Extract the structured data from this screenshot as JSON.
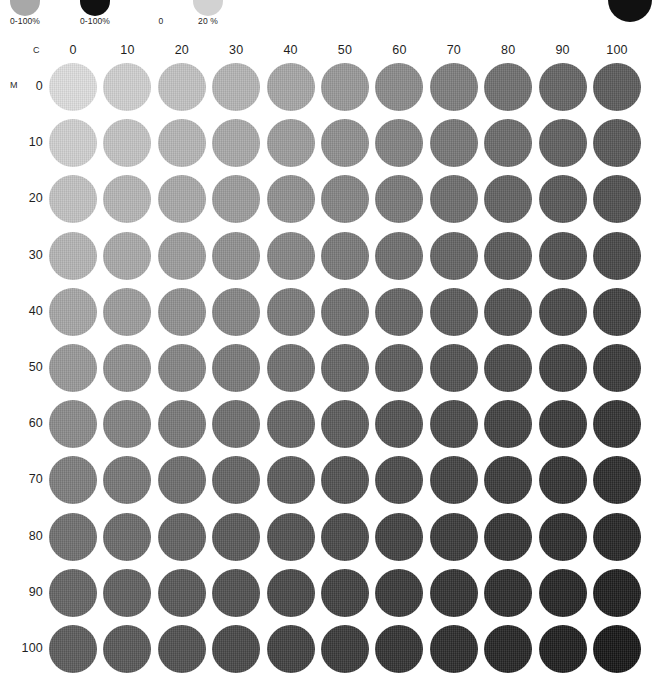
{
  "page": {
    "background": "#ffffff",
    "width": 649,
    "height": 673
  },
  "legend": {
    "items": [
      {
        "name": "gray-ramp-swatch",
        "label": "0-100%",
        "color": "#a8a8a8",
        "x": 25,
        "top": -14,
        "size": 30
      },
      {
        "name": "black-ramp-swatch",
        "label": "0-100%",
        "color": "#111111",
        "x": 95,
        "top": -14,
        "size": 30
      },
      {
        "name": "zero-tint-swatch",
        "label": "0",
        "color": "#ffffff",
        "x": 161,
        "top": -14,
        "size": 30
      },
      {
        "name": "twenty-tint-swatch",
        "label": "20 %",
        "color": "#d2d2d2",
        "x": 208,
        "top": -14,
        "size": 30
      }
    ],
    "corner_dot": {
      "name": "corner-black-dot",
      "color": "#111111",
      "x": 608,
      "top": -22,
      "size": 44
    }
  },
  "chart_data": {
    "type": "heatmap",
    "xlabel": "C",
    "ylabel": "M",
    "grid": false,
    "legend_position": "top",
    "unit": "%",
    "x": [
      0,
      10,
      20,
      30,
      40,
      50,
      60,
      70,
      80,
      90,
      100
    ],
    "y": [
      0,
      10,
      20,
      30,
      40,
      50,
      60,
      70,
      80,
      90,
      100
    ],
    "xtick_labels": [
      "0",
      "10",
      "20",
      "30",
      "40",
      "50",
      "60",
      "70",
      "80",
      "90",
      "100"
    ],
    "ytick_labels": [
      "0",
      "10",
      "20",
      "30",
      "40",
      "50",
      "60",
      "70",
      "80",
      "90",
      "100"
    ],
    "xlim": [
      0,
      100
    ],
    "ylim": [
      0,
      100
    ],
    "value_description": "Rendered gray level of each C/M halftone patch (0 = white paper, 100 = solid black)",
    "values": [
      [
        13,
        19,
        25,
        31,
        37,
        43,
        49,
        55,
        61,
        67,
        72
      ],
      [
        19,
        25,
        31,
        36,
        42,
        48,
        54,
        59,
        65,
        70,
        75
      ],
      [
        25,
        31,
        36,
        42,
        47,
        53,
        58,
        63,
        69,
        74,
        78
      ],
      [
        31,
        36,
        42,
        47,
        52,
        57,
        63,
        68,
        72,
        77,
        81
      ],
      [
        37,
        42,
        47,
        52,
        57,
        62,
        67,
        72,
        76,
        80,
        84
      ],
      [
        43,
        48,
        53,
        57,
        62,
        67,
        71,
        76,
        80,
        84,
        87
      ],
      [
        49,
        54,
        58,
        63,
        67,
        71,
        76,
        80,
        83,
        87,
        90
      ],
      [
        55,
        59,
        63,
        68,
        72,
        76,
        80,
        83,
        87,
        90,
        92
      ],
      [
        61,
        65,
        69,
        72,
        76,
        80,
        83,
        87,
        90,
        92,
        94
      ],
      [
        67,
        70,
        74,
        77,
        80,
        84,
        87,
        90,
        92,
        94,
        96
      ],
      [
        72,
        75,
        78,
        81,
        84,
        87,
        90,
        92,
        94,
        96,
        97
      ]
    ],
    "colors": [
      [
        "#dedede",
        "#d0d0d0",
        "#c2c2c2",
        "#b4b4b4",
        "#a6a6a6",
        "#989898",
        "#8a8a8a",
        "#7d7d7d",
        "#6f6f6f",
        "#646464",
        "#5b5b5b"
      ],
      [
        "#d0d0d0",
        "#c3c3c3",
        "#b5b5b5",
        "#a9a9a9",
        "#9c9c9c",
        "#8f8f8f",
        "#828282",
        "#767676",
        "#6a6a6a",
        "#5f5f5f",
        "#575757"
      ],
      [
        "#c2c2c2",
        "#b5b5b5",
        "#a9a9a9",
        "#9c9c9c",
        "#909090",
        "#848484",
        "#787878",
        "#6d6d6d",
        "#616161",
        "#575757",
        "#4f4f4f"
      ],
      [
        "#b4b4b4",
        "#a9a9a9",
        "#9c9c9c",
        "#909090",
        "#858585",
        "#797979",
        "#6e6e6e",
        "#636363",
        "#585858",
        "#4f4f4f",
        "#474747"
      ],
      [
        "#a6a6a6",
        "#9c9c9c",
        "#909090",
        "#858585",
        "#7a7a7a",
        "#6f6f6f",
        "#646464",
        "#5a5a5a",
        "#505050",
        "#474747",
        "#3f3f3f"
      ],
      [
        "#989898",
        "#8f8f8f",
        "#848484",
        "#797979",
        "#6f6f6f",
        "#656565",
        "#5b5b5b",
        "#515151",
        "#484848",
        "#3f3f3f",
        "#383838"
      ],
      [
        "#8a8a8a",
        "#828282",
        "#787878",
        "#6e6e6e",
        "#646464",
        "#5b5b5b",
        "#515151",
        "#494949",
        "#404040",
        "#383838",
        "#313131"
      ],
      [
        "#7d7d7d",
        "#767676",
        "#6d6d6d",
        "#636363",
        "#5a5a5a",
        "#515151",
        "#494949",
        "#414141",
        "#393939",
        "#313131",
        "#2b2b2b"
      ],
      [
        "#6f6f6f",
        "#6a6a6a",
        "#616161",
        "#585858",
        "#505050",
        "#484848",
        "#404040",
        "#393939",
        "#313131",
        "#2b2b2b",
        "#252525"
      ],
      [
        "#646464",
        "#5f5f5f",
        "#575757",
        "#4f4f4f",
        "#474747",
        "#3f3f3f",
        "#383838",
        "#313131",
        "#2b2b2b",
        "#242424",
        "#1d1d1d"
      ],
      [
        "#5b5b5b",
        "#575757",
        "#4f4f4f",
        "#474747",
        "#3f3f3f",
        "#383838",
        "#313131",
        "#2b2b2b",
        "#242424",
        "#1d1d1d",
        "#151515"
      ]
    ]
  },
  "layout": {
    "grid_left": 49,
    "grid_top": 23,
    "col_pitch": 54.4,
    "row_pitch": 56.2,
    "patch_size": 48,
    "col_label_y": 3,
    "row_label_right": 43,
    "c_letter": {
      "x": 33,
      "y": 5
    },
    "m_letter": {
      "x": 10,
      "y": 40
    }
  }
}
